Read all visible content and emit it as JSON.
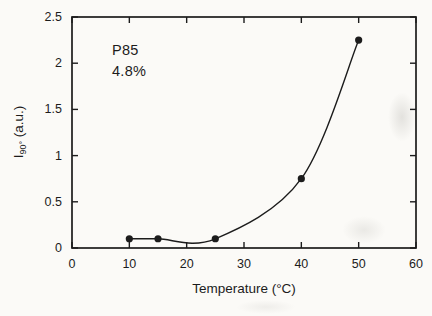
{
  "chart_data": {
    "type": "line",
    "x": [
      10,
      15,
      25,
      40,
      50
    ],
    "values": [
      0.1,
      0.1,
      0.1,
      0.75,
      2.25
    ],
    "series_name": "I90 vs Temperature",
    "annotation": {
      "line1": "P85",
      "line2": "4.8%"
    },
    "xlabel": "Temperature  (°C)",
    "ylabel_main": "I",
    "ylabel_sub": "90°",
    "ylabel_unit": " (a.u.)",
    "xlim": [
      0,
      60
    ],
    "ylim": [
      0,
      2.5
    ],
    "x_ticks": [
      0,
      10,
      20,
      30,
      40,
      50,
      60
    ],
    "y_ticks": [
      0,
      0.5,
      1,
      1.5,
      2,
      2.5
    ],
    "x_tick_labels": [
      "0",
      "10",
      "20",
      "30",
      "40",
      "50",
      "60"
    ],
    "y_tick_labels": [
      "0",
      "0.5",
      "1",
      "1.5",
      "2",
      "2.5"
    ],
    "grid": false,
    "legend": "none",
    "marker": "filled-circle",
    "ink_color": "#1c1c1c",
    "background_color": "#fbfaf7"
  }
}
